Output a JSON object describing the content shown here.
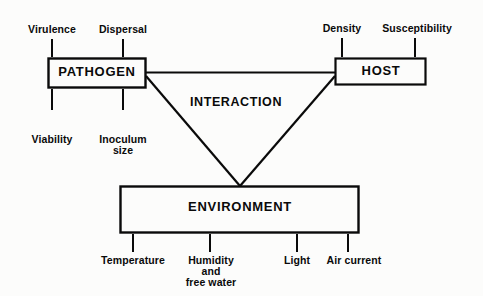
{
  "diagram": {
    "background_color": "#fcfcfb",
    "line_color": "#0a0a0a",
    "text_color": "#0a0a0a",
    "nodes": {
      "pathogen": {
        "label": "PATHOGEN"
      },
      "host": {
        "label": "HOST"
      },
      "environment": {
        "label": "ENVIRONMENT"
      },
      "interaction": {
        "label": "INTERACTION"
      }
    },
    "pathogen_factors": {
      "top_left": "Virulence",
      "top_right": "Dispersal",
      "bottom_left": "Viability",
      "bottom_right_line1": "Inoculum",
      "bottom_right_line2": "size"
    },
    "host_factors": {
      "top_left": "Density",
      "top_right": "Susceptibility"
    },
    "environment_factors": {
      "one": "Temperature",
      "two_line1": "Humidity",
      "two_line2": "and",
      "two_line3": "free water",
      "three": "Light",
      "four": "Air current"
    }
  }
}
